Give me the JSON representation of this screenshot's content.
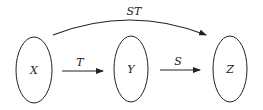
{
  "diagram": {
    "type": "function-composition",
    "nodes": [
      {
        "id": "X",
        "label": "X"
      },
      {
        "id": "Y",
        "label": "Y"
      },
      {
        "id": "Z",
        "label": "Z"
      }
    ],
    "edges": [
      {
        "from": "X",
        "to": "Y",
        "label": "T"
      },
      {
        "from": "Y",
        "to": "Z",
        "label": "S"
      },
      {
        "from": "X",
        "to": "Z",
        "label": "ST"
      }
    ]
  }
}
